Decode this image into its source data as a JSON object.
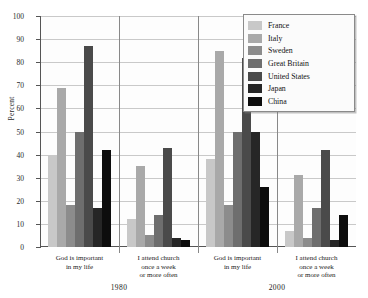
{
  "chart_data": {
    "type": "bar",
    "title": "",
    "xlabel": "",
    "ylabel": "Percent",
    "ylim": [
      0,
      100
    ],
    "ytick_step": 10,
    "yticks": [
      0,
      10,
      20,
      30,
      40,
      50,
      60,
      70,
      80,
      90,
      100
    ],
    "grid": true,
    "legend_position": "top-right",
    "legend_entries": [
      "France",
      "Italy",
      "Sweden",
      "Great Britain",
      "United States",
      "Japan",
      "China"
    ],
    "series": [
      {
        "name": "France",
        "color": "#c8c8c8",
        "values": [
          40,
          12,
          38,
          7
        ]
      },
      {
        "name": "Italy",
        "color": "#a9a9a9",
        "values": [
          69,
          35,
          85,
          31
        ]
      },
      {
        "name": "Sweden",
        "color": "#8c8c8c",
        "values": [
          18,
          5,
          18,
          4
        ]
      },
      {
        "name": "Great Britain",
        "color": "#6e6e6e",
        "values": [
          50,
          14,
          50,
          17
        ]
      },
      {
        "name": "United States",
        "color": "#4a4a4a",
        "values": [
          87,
          43,
          82,
          42
        ]
      },
      {
        "name": "Japan",
        "color": "#262626",
        "values": [
          17,
          4,
          50,
          3
        ]
      },
      {
        "name": "China",
        "color": "#0d0d0d",
        "values": [
          42,
          3,
          26,
          14
        ]
      }
    ],
    "groups": [
      {
        "label_lines": [
          "God is important",
          "in my life"
        ],
        "year": "1980"
      },
      {
        "label_lines": [
          "I attend church",
          "once a week",
          "or more often"
        ],
        "year": "1980"
      },
      {
        "label_lines": [
          "God is important",
          "in my life"
        ],
        "year": "2000"
      },
      {
        "label_lines": [
          "I attend church",
          "once a week",
          "or more often"
        ],
        "year": "2000"
      }
    ],
    "year_labels": [
      "1980",
      "2000"
    ]
  },
  "axis": {
    "y_label": "Percent"
  }
}
